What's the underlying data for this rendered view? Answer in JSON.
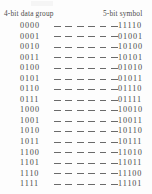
{
  "figure": {
    "left_header": "4-bit data group",
    "right_header": "5-bit symbol",
    "leader_dash_count": 6
  },
  "chart_data": {
    "type": "table",
    "title": "",
    "columns": [
      "4-bit data group",
      "5-bit symbol"
    ],
    "rows": [
      {
        "data_group": "0000",
        "symbol": "11110"
      },
      {
        "data_group": "0001",
        "symbol": "01001"
      },
      {
        "data_group": "0010",
        "symbol": "10100"
      },
      {
        "data_group": "0011",
        "symbol": "10101"
      },
      {
        "data_group": "0100",
        "symbol": "01010"
      },
      {
        "data_group": "0101",
        "symbol": "01011"
      },
      {
        "data_group": "0110",
        "symbol": "01110"
      },
      {
        "data_group": "0111",
        "symbol": "01111"
      },
      {
        "data_group": "1000",
        "symbol": "10010"
      },
      {
        "data_group": "1001",
        "symbol": "10011"
      },
      {
        "data_group": "1010",
        "symbol": "10110"
      },
      {
        "data_group": "1011",
        "symbol": "10111"
      },
      {
        "data_group": "1100",
        "symbol": "11010"
      },
      {
        "data_group": "1101",
        "symbol": "11011"
      },
      {
        "data_group": "1110",
        "symbol": "11100"
      },
      {
        "data_group": "1111",
        "symbol": "11101"
      }
    ]
  }
}
